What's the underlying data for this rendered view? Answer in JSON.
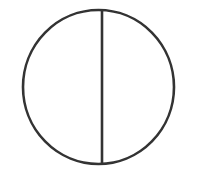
{
  "canvas": {
    "width": 198,
    "height": 178,
    "background_color": "#ffffff",
    "title": "Bisected circle line drawing"
  },
  "style": {
    "stroke_color": "#333333",
    "circle_stroke_width": 2.6,
    "line_stroke_width": 2.6,
    "fill": "none"
  },
  "figure": {
    "name": "circle-with-vertical-diameter",
    "shapes": [
      {
        "id": "outer-circle",
        "type": "ellipse",
        "center_x": 98.5,
        "center_y": 87,
        "radius_x": 75.5,
        "radius_y": 77,
        "bounds": {
          "left": 23,
          "top": 10,
          "right": 174,
          "bottom": 164
        }
      },
      {
        "id": "vertical-divider",
        "type": "line",
        "x1": 102,
        "y1": 11,
        "x2": 102,
        "y2": 163
      }
    ]
  }
}
